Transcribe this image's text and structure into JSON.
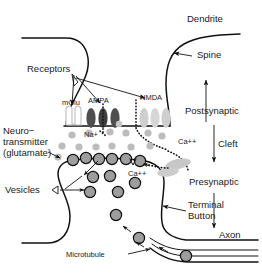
{
  "figure": {
    "type": "biological-diagram"
  },
  "labels": {
    "dendrite": "Dendrite",
    "spine": "Spine",
    "receptors": "Receptors",
    "mglu": "mGlu",
    "ampa": "AMPA",
    "nmda": "NMDA",
    "postsynaptic": "Postsynaptic",
    "cleft": "Cleft",
    "presynaptic": "Presynaptic",
    "neurotransmitter_line1": "Neuro−",
    "neurotransmitter_line2": "transmitter",
    "neurotransmitter_line3": "(glutamate)",
    "sodium": "Na+",
    "calcium_cleft": "Ca++",
    "calcium_terminal": "Ca++",
    "vesicles": "Vesicles",
    "terminal_line1": "Terminal",
    "terminal_line2": "Button",
    "axon": "Axon",
    "microtubule": "Microtubule"
  },
  "colors": {
    "outline": "#111111",
    "text": "#1a1a1a",
    "background": "#ffffff",
    "receptor_dark": "#4a4a4a",
    "receptor_mid": "#8c8c8c",
    "receptor_light": "#c9c9c9",
    "vesicle_fill": "#9a9a9a",
    "transmitter_dot": "#b5b5b5",
    "calcium_blob": "#bdbdbd"
  },
  "elements": {
    "receptor_groups": [
      {
        "name": "mGlu",
        "count": 1,
        "shade": "light"
      },
      {
        "name": "AMPA",
        "count": 3,
        "shade": "dark"
      },
      {
        "name": "NMDA",
        "count": 3,
        "shade": "light"
      }
    ],
    "transmitter_dot_count": 14,
    "docked_vesicle_count": 6,
    "free_vesicle_count": 6,
    "axon_vesicle_count": 2
  }
}
